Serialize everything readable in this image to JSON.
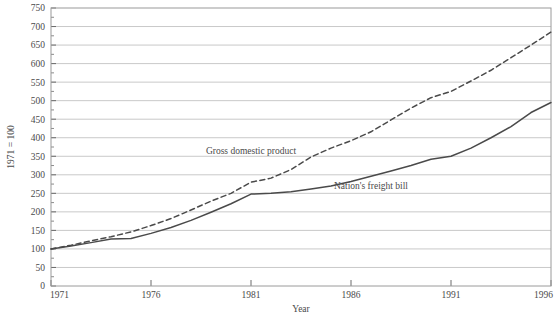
{
  "chart_data": {
    "type": "line",
    "title": "",
    "xlabel": "Year",
    "ylabel": "1971 = 100",
    "xlim": [
      1971,
      1996
    ],
    "ylim": [
      0,
      750
    ],
    "grid": true,
    "legend": "inline-labels",
    "xticks": [
      1971,
      1976,
      1981,
      1986,
      1991,
      1996
    ],
    "yticks": [
      0,
      50,
      100,
      150,
      200,
      250,
      300,
      350,
      400,
      450,
      500,
      550,
      600,
      650,
      700,
      750
    ],
    "x": [
      1971,
      1972,
      1973,
      1974,
      1975,
      1976,
      1977,
      1978,
      1979,
      1980,
      1981,
      1982,
      1983,
      1984,
      1985,
      1986,
      1987,
      1988,
      1989,
      1990,
      1991,
      1992,
      1993,
      1994,
      1995,
      1996
    ],
    "series": [
      {
        "name": "Gross domestic product",
        "style": "dashed",
        "color": "#4a4a4a",
        "label_x": 1981,
        "label_y": 355,
        "values": [
          100,
          110,
          122,
          133,
          146,
          163,
          182,
          205,
          229,
          250,
          280,
          291,
          314,
          348,
          372,
          392,
          416,
          448,
          480,
          508,
          525,
          553,
          582,
          616,
          650,
          685
        ]
      },
      {
        "name": "Nation's freight bill",
        "style": "solid",
        "color": "#4a4a4a",
        "label_x": 1987,
        "label_y": 262,
        "values": [
          100,
          108,
          117,
          127,
          128,
          142,
          158,
          177,
          199,
          222,
          248,
          250,
          254,
          262,
          270,
          282,
          296,
          310,
          325,
          342,
          350,
          372,
          400,
          430,
          468,
          495
        ]
      }
    ]
  }
}
